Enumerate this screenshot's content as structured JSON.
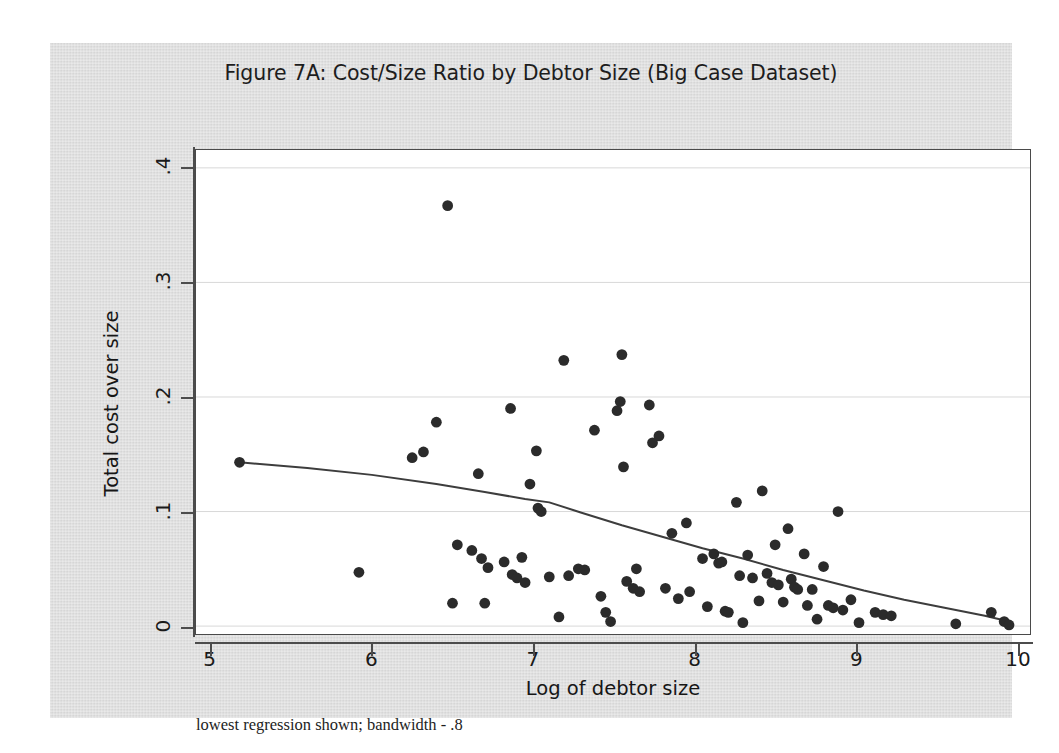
{
  "figure": {
    "title": "Figure 7A:  Cost/Size Ratio by Debtor Size (Big Case Dataset)",
    "footnote": "lowest regression shown; bandwidth - .8",
    "panel_color": "#dcdcdc",
    "plot_background": "#ffffff",
    "marker_color": "#2b2b2b",
    "line_color": "#3d3d3d",
    "grid_color": "#d8d8d8"
  },
  "chart_data": {
    "type": "scatter",
    "title": "Figure 7A:  Cost/Size Ratio by Debtor Size (Big Case Dataset)",
    "xlabel": "Log of debtor size",
    "ylabel": "Total cost over size",
    "xlim": [
      4.91,
      10.08
    ],
    "ylim": [
      -0.0069,
      0.4156
    ],
    "xticks": [
      5,
      6,
      7,
      8,
      9,
      10
    ],
    "xtick_labels": [
      "5",
      "6",
      "7",
      "8",
      "9",
      "10"
    ],
    "yticks": [
      0,
      0.1,
      0.2,
      0.3,
      0.4
    ],
    "ytick_labels": [
      "0",
      ".1",
      ".2",
      ".3",
      ".4"
    ],
    "grid": "horizontal",
    "legend": "none",
    "annotation": "lowest regression shown; bandwidth - .8",
    "series": [
      {
        "name": "Cases",
        "type": "scatter",
        "marker": "filled-circle",
        "points": [
          [
            5.18,
            0.143
          ],
          [
            5.92,
            0.047
          ],
          [
            6.25,
            0.147
          ],
          [
            6.32,
            0.152
          ],
          [
            6.4,
            0.178
          ],
          [
            6.47,
            0.367
          ],
          [
            6.5,
            0.02
          ],
          [
            6.53,
            0.071
          ],
          [
            6.62,
            0.066
          ],
          [
            6.66,
            0.133
          ],
          [
            6.68,
            0.059
          ],
          [
            6.7,
            0.02
          ],
          [
            6.72,
            0.051
          ],
          [
            6.82,
            0.056
          ],
          [
            6.86,
            0.19
          ],
          [
            6.87,
            0.045
          ],
          [
            6.9,
            0.042
          ],
          [
            6.93,
            0.06
          ],
          [
            6.95,
            0.038
          ],
          [
            6.98,
            0.124
          ],
          [
            7.02,
            0.153
          ],
          [
            7.03,
            0.103
          ],
          [
            7.05,
            0.1
          ],
          [
            7.1,
            0.043
          ],
          [
            7.16,
            0.008
          ],
          [
            7.19,
            0.232
          ],
          [
            7.22,
            0.044
          ],
          [
            7.28,
            0.05
          ],
          [
            7.32,
            0.049
          ],
          [
            7.38,
            0.171
          ],
          [
            7.42,
            0.026
          ],
          [
            7.45,
            0.012
          ],
          [
            7.48,
            0.004
          ],
          [
            7.52,
            0.188
          ],
          [
            7.54,
            0.196
          ],
          [
            7.55,
            0.237
          ],
          [
            7.56,
            0.139
          ],
          [
            7.58,
            0.039
          ],
          [
            7.62,
            0.033
          ],
          [
            7.64,
            0.05
          ],
          [
            7.66,
            0.03
          ],
          [
            7.72,
            0.193
          ],
          [
            7.74,
            0.16
          ],
          [
            7.78,
            0.166
          ],
          [
            7.82,
            0.033
          ],
          [
            7.86,
            0.081
          ],
          [
            7.9,
            0.024
          ],
          [
            7.95,
            0.09
          ],
          [
            7.97,
            0.03
          ],
          [
            8.05,
            0.059
          ],
          [
            8.08,
            0.017
          ],
          [
            8.12,
            0.063
          ],
          [
            8.15,
            0.055
          ],
          [
            8.17,
            0.056
          ],
          [
            8.19,
            0.013
          ],
          [
            8.21,
            0.012
          ],
          [
            8.26,
            0.108
          ],
          [
            8.28,
            0.044
          ],
          [
            8.3,
            0.003
          ],
          [
            8.33,
            0.062
          ],
          [
            8.36,
            0.042
          ],
          [
            8.4,
            0.022
          ],
          [
            8.42,
            0.118
          ],
          [
            8.45,
            0.046
          ],
          [
            8.48,
            0.038
          ],
          [
            8.5,
            0.071
          ],
          [
            8.52,
            0.036
          ],
          [
            8.55,
            0.021
          ],
          [
            8.58,
            0.085
          ],
          [
            8.6,
            0.041
          ],
          [
            8.62,
            0.034
          ],
          [
            8.64,
            0.032
          ],
          [
            8.68,
            0.063
          ],
          [
            8.7,
            0.018
          ],
          [
            8.73,
            0.032
          ],
          [
            8.76,
            0.006
          ],
          [
            8.8,
            0.052
          ],
          [
            8.83,
            0.018
          ],
          [
            8.86,
            0.016
          ],
          [
            8.89,
            0.1
          ],
          [
            8.92,
            0.014
          ],
          [
            8.97,
            0.023
          ],
          [
            9.02,
            0.003
          ],
          [
            9.12,
            0.012
          ],
          [
            9.17,
            0.01
          ],
          [
            9.22,
            0.009
          ],
          [
            9.62,
            0.002
          ],
          [
            9.84,
            0.012
          ],
          [
            9.92,
            0.004
          ],
          [
            9.95,
            0.001
          ]
        ]
      },
      {
        "name": "lowess regression",
        "type": "line",
        "points": [
          [
            5.18,
            0.143
          ],
          [
            5.6,
            0.138
          ],
          [
            6.0,
            0.132
          ],
          [
            6.4,
            0.124
          ],
          [
            6.7,
            0.117
          ],
          [
            6.95,
            0.111
          ],
          [
            7.1,
            0.108
          ],
          [
            7.3,
            0.099
          ],
          [
            7.55,
            0.088
          ],
          [
            7.8,
            0.078
          ],
          [
            8.05,
            0.068
          ],
          [
            8.3,
            0.059
          ],
          [
            8.55,
            0.049
          ],
          [
            8.8,
            0.04
          ],
          [
            9.05,
            0.031
          ],
          [
            9.3,
            0.023
          ],
          [
            9.55,
            0.016
          ],
          [
            9.8,
            0.009
          ],
          [
            9.95,
            0.004
          ]
        ]
      }
    ]
  }
}
